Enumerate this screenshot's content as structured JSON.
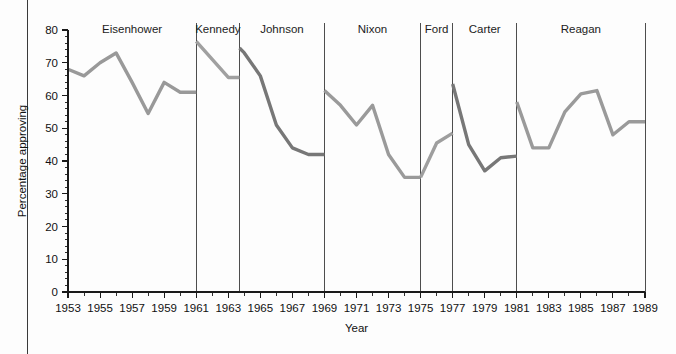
{
  "figure": {
    "background_color": "#fdfdfd",
    "left_rule_color": "#3a3a3a"
  },
  "chart_data": {
    "type": "line",
    "title": "",
    "xlabel": "Year",
    "ylabel": "Percentage approving",
    "xlim": [
      1953,
      1989
    ],
    "ylim": [
      0,
      80
    ],
    "y_ticks": [
      0,
      10,
      20,
      30,
      40,
      50,
      60,
      70,
      80
    ],
    "y_tick_labels": [
      "0",
      "10",
      "20",
      "30",
      "40",
      "50",
      "60",
      "70",
      "80"
    ],
    "y_minor_tick_step": 2,
    "x_ticks": [
      1953,
      1955,
      1957,
      1959,
      1961,
      1963,
      1965,
      1967,
      1969,
      1971,
      1973,
      1975,
      1977,
      1979,
      1981,
      1983,
      1985,
      1987,
      1989
    ],
    "x_tick_labels": [
      "1953",
      "1955",
      "1957",
      "1959",
      "1961",
      "1963",
      "1965",
      "1967",
      "1969",
      "1971",
      "1973",
      "1975",
      "1977",
      "1979",
      "1981",
      "1983",
      "1985",
      "1987",
      "1989"
    ],
    "x_minor_tick_step": 1,
    "grid": false,
    "legend": "none",
    "dividers": [
      1961,
      1963.7,
      1969,
      1975,
      1977,
      1981,
      1989
    ],
    "series": [
      {
        "name": "Eisenhower",
        "label": "Eisenhower",
        "color": "#999999",
        "label_x": 1957,
        "x": [
          1953,
          1954,
          1955,
          1956,
          1957,
          1958,
          1959,
          1960,
          1961
        ],
        "values": [
          68,
          66,
          70,
          73,
          64,
          54.5,
          64,
          61,
          61
        ]
      },
      {
        "name": "Kennedy",
        "label": "Kennedy",
        "color": "#a0a0a0",
        "label_x": 1962.35,
        "x": [
          1961,
          1962,
          1963,
          1963.7
        ],
        "values": [
          76.5,
          71,
          65.5,
          65.5
        ]
      },
      {
        "name": "Johnson",
        "label": "Johnson",
        "color": "#777777",
        "label_x": 1966.35,
        "x": [
          1963.7,
          1964,
          1965,
          1966,
          1967,
          1968,
          1969
        ],
        "values": [
          74.5,
          73,
          66,
          51,
          44,
          42,
          42
        ]
      },
      {
        "name": "Nixon",
        "label": "Nixon",
        "color": "#9a9a9a",
        "label_x": 1972,
        "x": [
          1969,
          1970,
          1971,
          1972,
          1973,
          1974,
          1975
        ],
        "values": [
          61.5,
          57,
          51,
          57,
          42,
          35,
          35
        ]
      },
      {
        "name": "Ford",
        "label": "Ford",
        "color": "#9e9e9e",
        "label_x": 1976,
        "x": [
          1975,
          1976,
          1977
        ],
        "values": [
          35,
          45.5,
          48.5
        ]
      },
      {
        "name": "Carter",
        "label": "Carter",
        "color": "#777777",
        "label_x": 1979,
        "x": [
          1977,
          1978,
          1979,
          1980,
          1981
        ],
        "values": [
          63.5,
          45,
          37,
          41,
          41.5
        ]
      },
      {
        "name": "Reagan",
        "label": "Reagan",
        "color": "#9a9a9a",
        "label_x": 1985,
        "x": [
          1981,
          1982,
          1983,
          1984,
          1985,
          1986,
          1987,
          1988,
          1989
        ],
        "values": [
          58,
          44,
          44,
          55,
          60.5,
          61.5,
          48,
          52,
          52
        ]
      }
    ]
  }
}
